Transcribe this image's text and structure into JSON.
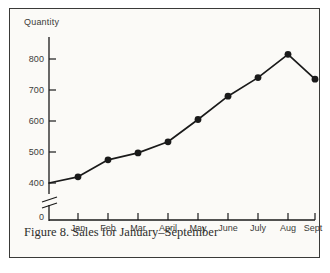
{
  "figure": {
    "caption": "Figure 8. Sales for January–September",
    "border_color": "#3a3a38",
    "background_color": "#fbfaf7",
    "ink_color": "#1a1a1a"
  },
  "chart_data": {
    "type": "line",
    "title": "",
    "ylabel": "Quantity",
    "xlabel": "",
    "categories": [
      "Jan",
      "Feb",
      "Mar",
      "April",
      "May",
      "June",
      "July",
      "Aug",
      "Sept"
    ],
    "values": [
      420,
      475,
      497,
      533,
      605,
      680,
      740,
      815,
      735
    ],
    "yticks": [
      0,
      400,
      500,
      600,
      700,
      800
    ],
    "ytick_labels": [
      "0",
      "400",
      "500",
      "600",
      "700",
      "800"
    ],
    "ylim": [
      400,
      850
    ],
    "axis_break": true,
    "axis_break_label": "//",
    "grid": false,
    "legend": null,
    "marker": "filled-circle",
    "line_color": "#1a1a1a",
    "marker_color": "#1a1a1a",
    "start_value": 400,
    "start_label": ""
  }
}
